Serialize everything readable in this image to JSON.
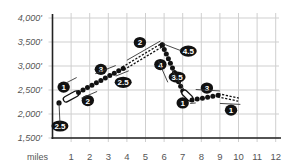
{
  "chart_data": {
    "type": "line",
    "title": "",
    "xlabel": "miles",
    "ylabel": "",
    "xlim": [
      0,
      12
    ],
    "ylim": [
      1500,
      4000
    ],
    "grid": true,
    "x_ticks": [
      "1",
      "2",
      "3",
      "4",
      "5",
      "6",
      "7",
      "8",
      "9",
      "10",
      "11",
      "12"
    ],
    "y_ticks": [
      "1,500'",
      "2,000'",
      "2,500'",
      "3,000'",
      "3,500'",
      "4,000'"
    ],
    "series": [
      {
        "name": "Elevation profile",
        "x": [
          0.35,
          0.7,
          1.4,
          1.7,
          2.1,
          2.5,
          2.9,
          3.3,
          3.8,
          4.5,
          5.2,
          5.9,
          6.1,
          6.3,
          6.5,
          6.7,
          6.9,
          7.1,
          7.5,
          7.9,
          8.3,
          8.7,
          9.0,
          9.5,
          10.0
        ],
        "y": [
          2230,
          2300,
          2450,
          2500,
          2580,
          2660,
          2750,
          2830,
          2950,
          3120,
          3290,
          3440,
          3260,
          3080,
          2900,
          2720,
          2560,
          2400,
          2290,
          2400,
          2420,
          2410,
          2380,
          2340,
          2300
        ]
      }
    ],
    "segments": [
      {
        "style": "paved",
        "from_mile": 0.6,
        "to_mile": 1.4
      },
      {
        "style": "trail",
        "from_mile": 1.4,
        "to_mile": 3.8
      },
      {
        "style": "dashed",
        "from_mile": 3.8,
        "to_mile": 5.9
      },
      {
        "style": "trail",
        "from_mile": 5.9,
        "to_mile": 7.0
      },
      {
        "style": "paved",
        "from_mile": 7.0,
        "to_mile": 7.5
      },
      {
        "style": "trail",
        "from_mile": 7.5,
        "to_mile": 8.9
      },
      {
        "style": "dashed",
        "from_mile": 8.9,
        "to_mile": 10.0
      }
    ],
    "annotations": [
      {
        "label": "2.5",
        "mile": 0.4,
        "elev": 1750
      },
      {
        "label": "1",
        "mile": 0.6,
        "elev": 2560
      },
      {
        "label": "2",
        "mile": 1.9,
        "elev": 2280
      },
      {
        "label": "3",
        "mile": 2.6,
        "elev": 2930
      },
      {
        "label": "2.5",
        "mile": 3.8,
        "elev": 2660
      },
      {
        "label": "2",
        "mile": 4.7,
        "elev": 3490
      },
      {
        "label": "4.5",
        "mile": 7.3,
        "elev": 3310
      },
      {
        "label": "4",
        "mile": 5.8,
        "elev": 3030
      },
      {
        "label": "3.5",
        "mile": 6.7,
        "elev": 2770
      },
      {
        "label": "1",
        "mile": 7.0,
        "elev": 2230
      },
      {
        "label": "3",
        "mile": 8.3,
        "elev": 2540
      },
      {
        "label": "1",
        "mile": 9.6,
        "elev": 2080
      }
    ]
  }
}
